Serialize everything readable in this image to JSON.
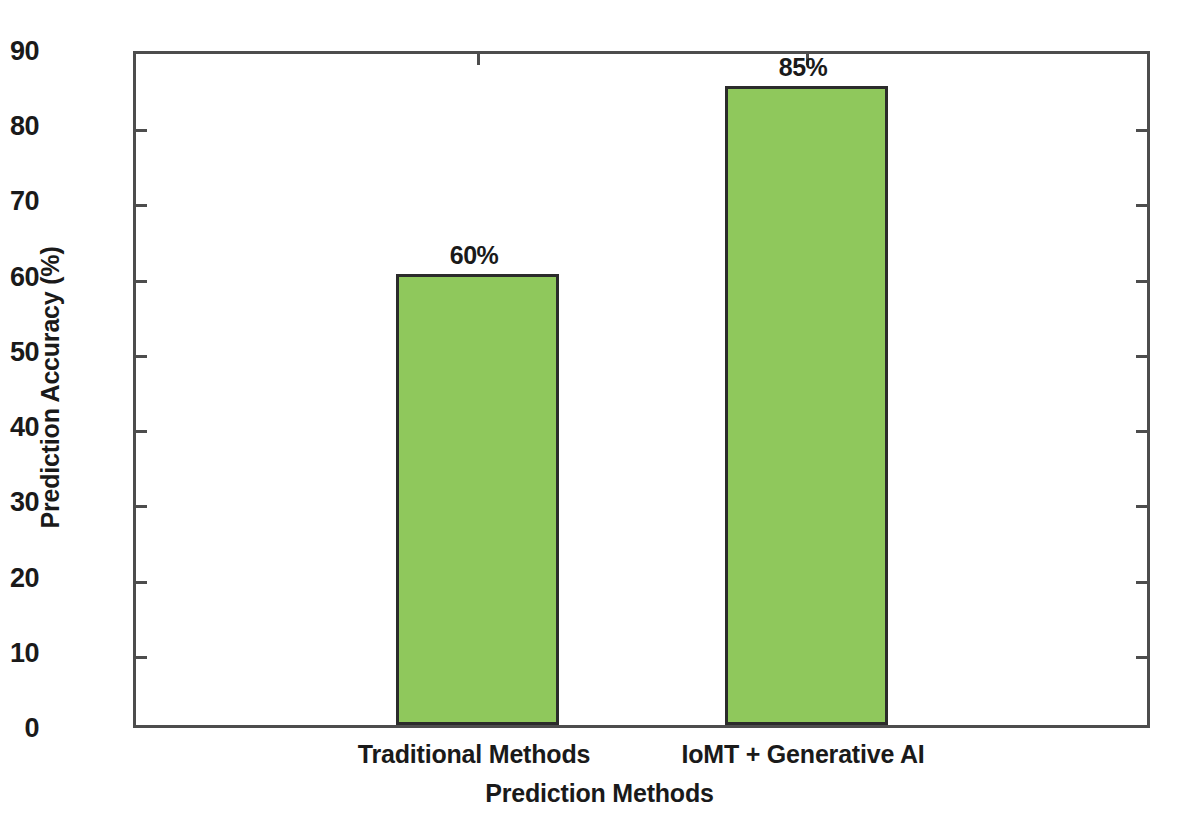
{
  "chart_data": {
    "type": "bar",
    "title": "",
    "xlabel": "Prediction Methods",
    "ylabel": "Prediction Accuracy (%)",
    "categories": [
      "Traditional Methods",
      "IoMT + Generative AI"
    ],
    "values": [
      60,
      85
    ],
    "data_labels": [
      "60%",
      "85%"
    ],
    "ylim": [
      0,
      90
    ],
    "yticks": [
      0,
      10,
      20,
      30,
      40,
      50,
      60,
      70,
      80,
      90
    ],
    "ytick_labels": [
      "0",
      "10",
      "20",
      "30",
      "40",
      "50",
      "60",
      "70",
      "80",
      "90"
    ],
    "grid": false,
    "legend": null,
    "series": [
      {
        "name": "Prediction Accuracy",
        "values": [
          60,
          85
        ],
        "color": "#8fc85c",
        "edge_color": "#2b2b2b"
      }
    ],
    "colors": {
      "bar_fill": "#8fc85c",
      "bar_edge": "#2b2b2b",
      "axis": "#4d4d4d",
      "text": "#1a1a1a",
      "background": "#ffffff"
    }
  }
}
